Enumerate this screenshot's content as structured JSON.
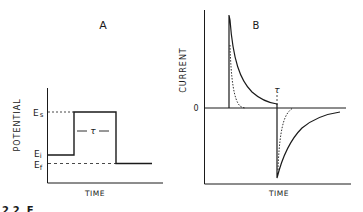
{
  "panel_a": {
    "title": "A",
    "ylabel": "POTENTIAL",
    "xlabel": "TIME",
    "levels": {
      "Es": "E",
      "Es_sub": "s",
      "Ei": "E",
      "Ei_sub": "i",
      "Ef": "E",
      "Ef_sub": "f"
    },
    "tau": "τ"
  },
  "panel_b": {
    "title": "B",
    "ylabel": "CURRENT",
    "xlabel": "TIME",
    "zero_label": "0",
    "tau": "τ"
  },
  "caption_fragment": "2.2  F",
  "colors": {
    "ink": "#1a1a1a",
    "background": "#ffffff"
  }
}
